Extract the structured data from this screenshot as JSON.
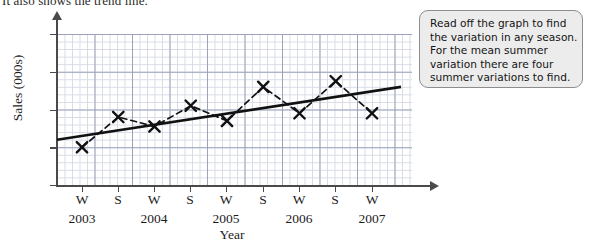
{
  "intro_text": "It also shows the trend line.",
  "chart_data": {
    "type": "line",
    "title": "",
    "xlabel": "Year",
    "ylabel": "Sales (000s)",
    "ylim": [
      0,
      80
    ],
    "yticks": [
      0,
      20,
      40,
      60,
      80
    ],
    "grid": true,
    "legend": "none",
    "categories": [
      "W",
      "S",
      "W",
      "S",
      "W",
      "S",
      "W",
      "S",
      "W"
    ],
    "year_labels": [
      "2003",
      "2004",
      "2005",
      "2006",
      "2007"
    ],
    "series": [
      {
        "name": "Sales",
        "style": "dashed-with-x-markers",
        "values": [
          20,
          36,
          31,
          42,
          34,
          52,
          38,
          55,
          38
        ]
      },
      {
        "name": "Trend line",
        "style": "solid",
        "endpoints": [
          24,
          52
        ]
      }
    ]
  },
  "note": {
    "lines": [
      "Read off the graph to find",
      "the variation in any season.",
      "For the mean summer",
      "variation there are four",
      "summer variations to find."
    ]
  },
  "colors": {
    "axis": "#4a4a4a",
    "series": "#111111",
    "trend": "#111111",
    "grid_major": "#9aa3bb",
    "grid_minor": "#d7dbe6",
    "note_fill": "#ececec",
    "note_border": "#8d8d8d"
  }
}
